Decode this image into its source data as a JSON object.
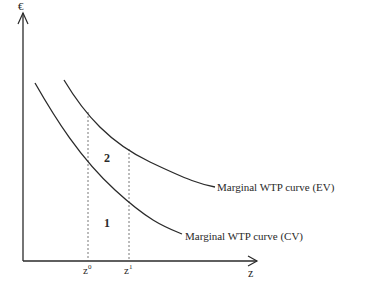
{
  "diagram": {
    "y_axis_label": "€",
    "x_axis_label": "z",
    "tick_labels": {
      "z0": {
        "base": "z",
        "sup": "0"
      },
      "z1": {
        "base": "z",
        "sup": "1"
      }
    },
    "curves": [
      {
        "id": "ev",
        "label": "Marginal WTP curve (EV)"
      },
      {
        "id": "cv",
        "label": "Marginal WTP curve (CV)"
      }
    ],
    "regions": [
      {
        "id": "area-2",
        "label": "2"
      },
      {
        "id": "area-1",
        "label": "1"
      }
    ],
    "colors": {
      "line": "#2a2a2a",
      "dashed": "#555555",
      "background": "#ffffff"
    }
  }
}
